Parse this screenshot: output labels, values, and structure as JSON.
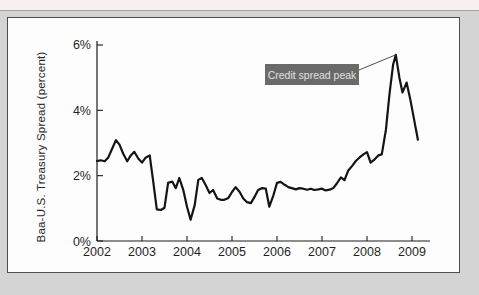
{
  "page": {
    "top_strip_color": "#f6f0ef",
    "background_color": "#d4d4d4",
    "panel_background": "#fdfdfd",
    "panel_border_color": "#4d4d4d"
  },
  "chart_data": {
    "type": "line",
    "title": "",
    "xlabel": "",
    "ylabel": "Baa-U.S. Treasury Spread (percent)",
    "xlim": [
      2002,
      2009.4
    ],
    "ylim": [
      0,
      6
    ],
    "grid": false,
    "legend": "none",
    "axis_color": "#1c1c1c",
    "tick_label_color": "#1f1f1f",
    "x_ticks": [
      {
        "value": 2002,
        "label": "2002"
      },
      {
        "value": 2003,
        "label": "2003"
      },
      {
        "value": 2004,
        "label": "2004"
      },
      {
        "value": 2005,
        "label": "2005"
      },
      {
        "value": 2006,
        "label": "2006"
      },
      {
        "value": 2007,
        "label": "2007"
      },
      {
        "value": 2008,
        "label": "2008"
      },
      {
        "value": 2009,
        "label": "2009"
      }
    ],
    "y_ticks": [
      {
        "value": 0,
        "label": "0%"
      },
      {
        "value": 2,
        "label": "2%"
      },
      {
        "value": 4,
        "label": "4%"
      },
      {
        "value": 6,
        "label": "6%"
      }
    ],
    "series": [
      {
        "name": "Baa-U.S. Treasury spread",
        "color": "#141414",
        "points": [
          [
            2002.0,
            2.45
          ],
          [
            2002.08,
            2.47
          ],
          [
            2002.17,
            2.44
          ],
          [
            2002.25,
            2.56
          ],
          [
            2002.33,
            2.8
          ],
          [
            2002.42,
            3.09
          ],
          [
            2002.5,
            2.95
          ],
          [
            2002.58,
            2.68
          ],
          [
            2002.67,
            2.44
          ],
          [
            2002.75,
            2.62
          ],
          [
            2002.83,
            2.73
          ],
          [
            2002.92,
            2.52
          ],
          [
            2003.0,
            2.4
          ],
          [
            2003.08,
            2.55
          ],
          [
            2003.17,
            2.62
          ],
          [
            2003.25,
            1.8
          ],
          [
            2003.33,
            0.97
          ],
          [
            2003.42,
            0.95
          ],
          [
            2003.5,
            1.02
          ],
          [
            2003.58,
            1.78
          ],
          [
            2003.67,
            1.82
          ],
          [
            2003.75,
            1.62
          ],
          [
            2003.83,
            1.93
          ],
          [
            2003.92,
            1.55
          ],
          [
            2004.0,
            1.05
          ],
          [
            2004.08,
            0.65
          ],
          [
            2004.17,
            1.1
          ],
          [
            2004.25,
            1.87
          ],
          [
            2004.33,
            1.93
          ],
          [
            2004.42,
            1.7
          ],
          [
            2004.5,
            1.47
          ],
          [
            2004.58,
            1.56
          ],
          [
            2004.67,
            1.3
          ],
          [
            2004.75,
            1.26
          ],
          [
            2004.83,
            1.26
          ],
          [
            2004.92,
            1.32
          ],
          [
            2005.0,
            1.5
          ],
          [
            2005.08,
            1.65
          ],
          [
            2005.17,
            1.5
          ],
          [
            2005.25,
            1.3
          ],
          [
            2005.33,
            1.19
          ],
          [
            2005.42,
            1.16
          ],
          [
            2005.5,
            1.35
          ],
          [
            2005.58,
            1.56
          ],
          [
            2005.67,
            1.62
          ],
          [
            2005.75,
            1.6
          ],
          [
            2005.83,
            1.05
          ],
          [
            2005.92,
            1.4
          ],
          [
            2006.0,
            1.78
          ],
          [
            2006.08,
            1.81
          ],
          [
            2006.17,
            1.72
          ],
          [
            2006.25,
            1.65
          ],
          [
            2006.33,
            1.62
          ],
          [
            2006.42,
            1.58
          ],
          [
            2006.5,
            1.62
          ],
          [
            2006.58,
            1.6
          ],
          [
            2006.67,
            1.57
          ],
          [
            2006.75,
            1.6
          ],
          [
            2006.83,
            1.56
          ],
          [
            2006.92,
            1.58
          ],
          [
            2007.0,
            1.6
          ],
          [
            2007.08,
            1.55
          ],
          [
            2007.17,
            1.57
          ],
          [
            2007.25,
            1.62
          ],
          [
            2007.33,
            1.76
          ],
          [
            2007.42,
            1.95
          ],
          [
            2007.5,
            1.86
          ],
          [
            2007.58,
            2.15
          ],
          [
            2007.67,
            2.3
          ],
          [
            2007.75,
            2.45
          ],
          [
            2007.83,
            2.55
          ],
          [
            2007.92,
            2.65
          ],
          [
            2008.0,
            2.72
          ],
          [
            2008.08,
            2.4
          ],
          [
            2008.17,
            2.5
          ],
          [
            2008.25,
            2.62
          ],
          [
            2008.33,
            2.65
          ],
          [
            2008.42,
            3.4
          ],
          [
            2008.5,
            4.5
          ],
          [
            2008.58,
            5.4
          ],
          [
            2008.64,
            5.7
          ],
          [
            2008.72,
            5.0
          ],
          [
            2008.79,
            4.55
          ],
          [
            2008.88,
            4.85
          ],
          [
            2008.96,
            4.35
          ],
          [
            2009.05,
            3.7
          ],
          [
            2009.13,
            3.1
          ]
        ]
      }
    ],
    "annotation": {
      "label": "Credit spread peak",
      "box_color": "#6a6a6a",
      "text_color": "#e3e0e0",
      "points_to": {
        "x": 2008.64,
        "y": 5.7
      },
      "peak_value_percent": 5.7
    }
  }
}
